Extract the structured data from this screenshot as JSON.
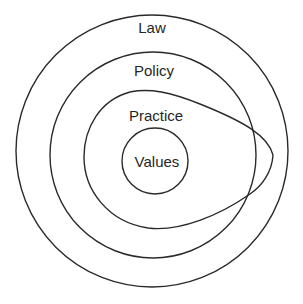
{
  "diagram": {
    "type": "nested-layers",
    "layers": [
      {
        "id": "law",
        "label": "Law"
      },
      {
        "id": "policy",
        "label": "Policy"
      },
      {
        "id": "practice",
        "label": "Practice"
      },
      {
        "id": "values",
        "label": "Values"
      }
    ]
  },
  "colors": {
    "stroke": "#2a2a2a",
    "text": "#262626",
    "background": "#ffffff"
  }
}
